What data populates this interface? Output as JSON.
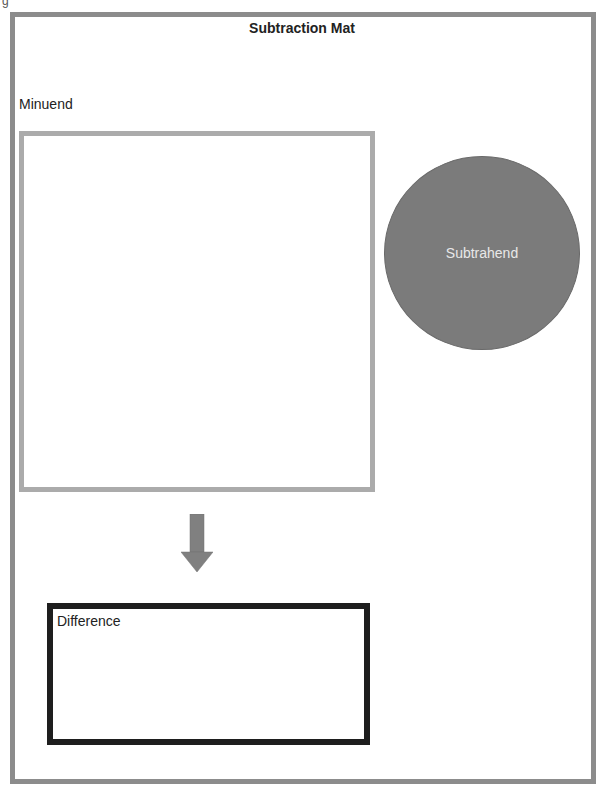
{
  "page": {
    "corner_mark": "g",
    "title": "Subtraction Mat",
    "minuend": {
      "label": "Minuend"
    },
    "subtrahend": {
      "label": "Subtrahend"
    },
    "difference": {
      "label": "Difference"
    },
    "arrow": {
      "icon": "arrow-down-icon",
      "direction": "down"
    }
  },
  "colors": {
    "outer_border": "#8c8c8c",
    "minuend_border": "#ababab",
    "subtrahend_fill": "#7b7b7b",
    "arrow_fill": "#808080",
    "difference_border": "#1e1e1e"
  }
}
